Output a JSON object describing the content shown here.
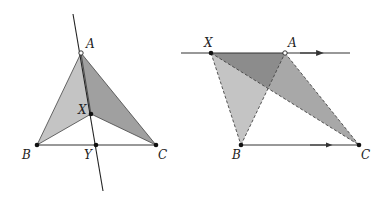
{
  "figures": [
    {
      "id": "left",
      "labels": {
        "A": "A",
        "X": "X",
        "B": "B",
        "Y": "Y",
        "C": "C"
      },
      "points": {
        "A": [
          81,
          53
        ],
        "X": [
          91,
          114
        ],
        "B": [
          37,
          145
        ],
        "Y": [
          96,
          145
        ],
        "C": [
          156,
          145
        ],
        "line_top": [
          73,
          14
        ],
        "line_bottom": [
          103,
          191
        ]
      }
    },
    {
      "id": "right",
      "labels": {
        "X": "X",
        "A": "A",
        "B": "B",
        "C": "C"
      },
      "points": {
        "X": [
          211,
          53
        ],
        "A": [
          285,
          53
        ],
        "B": [
          241,
          145
        ],
        "C": [
          359,
          145
        ],
        "line_left": [
          181,
          53
        ],
        "line_right": [
          350,
          53
        ],
        "overlap": [
          268,
          88
        ]
      }
    }
  ],
  "colors": {
    "light_fill": "#c4c4c4",
    "mid_fill": "#a8a8a8",
    "dark_fill": "#8c8c8c",
    "stroke": "#333333"
  }
}
